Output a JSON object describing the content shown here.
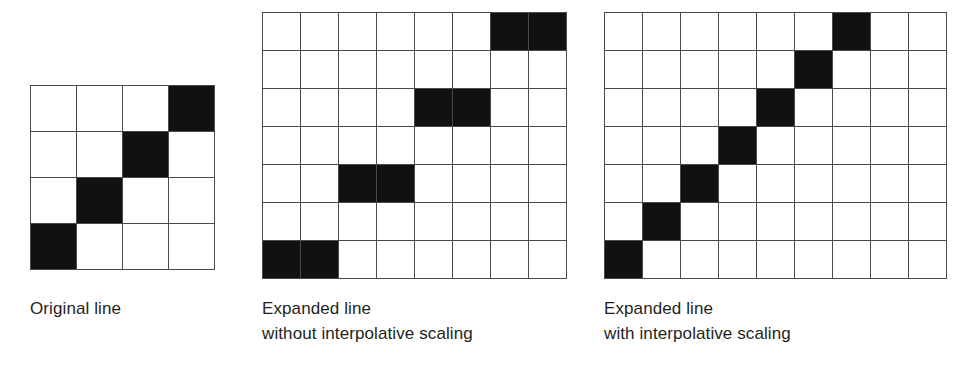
{
  "figure": {
    "background_color": "#ffffff",
    "cell_on_color": "#111111",
    "cell_off_color": "#ffffff",
    "grid_line_color": "#4a4a4a",
    "text_color": "#231f20"
  },
  "panels": [
    {
      "id": "original",
      "caption_line1": "Original line",
      "caption_line2": "",
      "grid": {
        "cols": 4,
        "rows": 4,
        "filled_cells": [
          [
            0,
            3
          ],
          [
            1,
            2
          ],
          [
            2,
            1
          ],
          [
            3,
            0
          ]
        ],
        "matrix": [
          [
            0,
            0,
            0,
            1
          ],
          [
            0,
            0,
            1,
            0
          ],
          [
            0,
            1,
            0,
            0
          ],
          [
            1,
            0,
            0,
            0
          ]
        ]
      }
    },
    {
      "id": "expanded-nointerp",
      "caption_line1": "Expanded line",
      "caption_line2": "without interpolative scaling",
      "grid": {
        "cols": 8,
        "rows": 7,
        "filled_cells": [
          [
            0,
            6
          ],
          [
            0,
            7
          ],
          [
            2,
            4
          ],
          [
            2,
            5
          ],
          [
            4,
            2
          ],
          [
            4,
            3
          ],
          [
            6,
            0
          ],
          [
            6,
            1
          ]
        ],
        "matrix": [
          [
            0,
            0,
            0,
            0,
            0,
            0,
            1,
            1
          ],
          [
            0,
            0,
            0,
            0,
            0,
            0,
            0,
            0
          ],
          [
            0,
            0,
            0,
            0,
            1,
            1,
            0,
            0
          ],
          [
            0,
            0,
            0,
            0,
            0,
            0,
            0,
            0
          ],
          [
            0,
            0,
            1,
            1,
            0,
            0,
            0,
            0
          ],
          [
            0,
            0,
            0,
            0,
            0,
            0,
            0,
            0
          ],
          [
            1,
            1,
            0,
            0,
            0,
            0,
            0,
            0
          ]
        ]
      }
    },
    {
      "id": "expanded-interp",
      "caption_line1": "Expanded line",
      "caption_line2": "with interpolative scaling",
      "grid": {
        "cols": 9,
        "rows": 7,
        "filled_cells": [
          [
            0,
            6
          ],
          [
            1,
            5
          ],
          [
            2,
            4
          ],
          [
            3,
            3
          ],
          [
            4,
            2
          ],
          [
            5,
            1
          ],
          [
            6,
            0
          ]
        ],
        "matrix": [
          [
            0,
            0,
            0,
            0,
            0,
            0,
            1,
            0,
            0
          ],
          [
            0,
            0,
            0,
            0,
            0,
            1,
            0,
            0,
            0
          ],
          [
            0,
            0,
            0,
            0,
            1,
            0,
            0,
            0,
            0
          ],
          [
            0,
            0,
            0,
            1,
            0,
            0,
            0,
            0,
            0
          ],
          [
            0,
            0,
            1,
            0,
            0,
            0,
            0,
            0,
            0
          ],
          [
            0,
            1,
            0,
            0,
            0,
            0,
            0,
            0,
            0
          ],
          [
            1,
            0,
            0,
            0,
            0,
            0,
            0,
            0,
            0
          ]
        ]
      }
    }
  ]
}
